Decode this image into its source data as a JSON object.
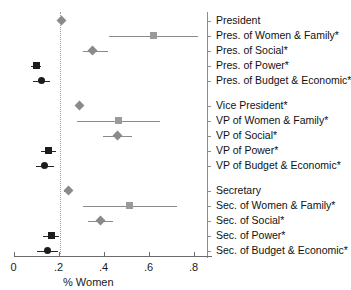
{
  "chart_data": {
    "type": "scatter",
    "title": "",
    "xlabel": "% Women",
    "ylabel": "",
    "xlim": [
      0,
      0.88
    ],
    "xticks": [
      0,
      0.2,
      0.4,
      0.6,
      0.8
    ],
    "xticklabels": [
      "0",
      ".2",
      ".4",
      ".6",
      ".8"
    ],
    "grid": false,
    "legend": false,
    "reference_line": 0.207,
    "orientation": "horizontal",
    "note": "Point estimates with horizontal confidence intervals; marker shape encodes portfolio type (diamond = overall/office, square = power, circle = budget & economic, square = women & family, diamond = social).",
    "groups": [
      {
        "name": "President",
        "rows": [
          {
            "label": "President",
            "value": 0.215,
            "ci_low": 0.215,
            "ci_high": 0.215,
            "marker": "diamond",
            "shade": "light",
            "starred": false
          },
          {
            "label": "Pres. of Women & Family*",
            "value": 0.62,
            "ci_low": 0.425,
            "ci_high": 0.82,
            "marker": "square",
            "shade": "light",
            "starred": true
          },
          {
            "label": "Pres. of Social*",
            "value": 0.35,
            "ci_low": 0.308,
            "ci_high": 0.42,
            "marker": "diamond",
            "shade": "light",
            "starred": true
          },
          {
            "label": "Pres. of Power*",
            "value": 0.1,
            "ci_low": 0.078,
            "ci_high": 0.122,
            "marker": "square",
            "shade": "dark",
            "starred": true
          },
          {
            "label": "Pres. of Budget & Economic*",
            "value": 0.123,
            "ci_low": 0.085,
            "ci_high": 0.163,
            "marker": "circle",
            "shade": "dark",
            "starred": true
          }
        ]
      },
      {
        "name": "Vice President",
        "rows": [
          {
            "label": "Vice President*",
            "value": 0.293,
            "ci_low": 0.276,
            "ci_high": 0.311,
            "marker": "diamond",
            "shade": "light",
            "starred": true
          },
          {
            "label": "VP of Women & Family*",
            "value": 0.467,
            "ci_low": 0.282,
            "ci_high": 0.649,
            "marker": "square",
            "shade": "light",
            "starred": true
          },
          {
            "label": "VP of Social*",
            "value": 0.464,
            "ci_low": 0.398,
            "ci_high": 0.527,
            "marker": "diamond",
            "shade": "light",
            "starred": true
          },
          {
            "label": "VP of Power*",
            "value": 0.156,
            "ci_low": 0.124,
            "ci_high": 0.189,
            "marker": "square",
            "shade": "dark",
            "starred": true
          },
          {
            "label": "VP of Budget & Economic*",
            "value": 0.138,
            "ci_low": 0.098,
            "ci_high": 0.182,
            "marker": "circle",
            "shade": "dark",
            "starred": true
          }
        ]
      },
      {
        "name": "Secretary",
        "rows": [
          {
            "label": "Secretary",
            "value": 0.244,
            "ci_low": 0.225,
            "ci_high": 0.262,
            "marker": "diamond",
            "shade": "light",
            "starred": false
          },
          {
            "label": "Sec. of Women & Family*",
            "value": 0.515,
            "ci_low": 0.311,
            "ci_high": 0.727,
            "marker": "square",
            "shade": "light",
            "starred": true
          },
          {
            "label": "Sec. of Social*",
            "value": 0.385,
            "ci_low": 0.33,
            "ci_high": 0.442,
            "marker": "diamond",
            "shade": "light",
            "starred": true
          },
          {
            "label": "Sec. of Power*",
            "value": 0.167,
            "ci_low": 0.133,
            "ci_high": 0.202,
            "marker": "square",
            "shade": "dark",
            "starred": true
          },
          {
            "label": "Sec. of Budget & Economic*",
            "value": 0.151,
            "ci_low": 0.104,
            "ci_high": 0.199,
            "marker": "circle",
            "shade": "dark",
            "starred": true
          }
        ]
      }
    ]
  },
  "colors": {
    "light_marker": "#9a9a9a",
    "dark_marker": "#1c1c1c",
    "ci_light": "#8a8a8a",
    "ci_dark": "#262626",
    "axis": "#6b6b6b",
    "reference": "#9a9a9a",
    "text": "#111111",
    "background": "#ffffff"
  }
}
